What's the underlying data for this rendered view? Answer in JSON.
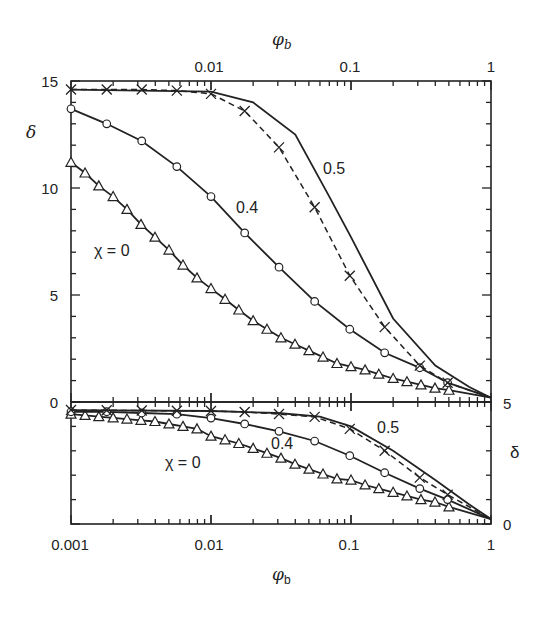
{
  "chart_data": [
    {
      "panel": "upper",
      "type": "line",
      "title": "",
      "xlabel": "φb",
      "ylabel": "δ",
      "xscale": "log",
      "xlim": [
        0.001,
        1
      ],
      "ylim": [
        0,
        15
      ],
      "x_axis_position": "top",
      "x_ticks": [
        "0.01",
        "0.1",
        "1"
      ],
      "y_ticks": [
        "0",
        "5",
        "10",
        "15"
      ],
      "grid": false,
      "annotations": [
        "χ = 0",
        "0.4",
        "0.5"
      ],
      "series": [
        {
          "name": "χ = 0 (triangles)",
          "marker": "triangle",
          "line": "solid",
          "x": [
            0.001,
            0.00126,
            0.00158,
            0.002,
            0.00251,
            0.00316,
            0.00398,
            0.00501,
            0.00631,
            0.00794,
            0.01,
            0.0126,
            0.0158,
            0.02,
            0.0251,
            0.0316,
            0.0398,
            0.0501,
            0.0631,
            0.0794,
            0.1,
            0.126,
            0.158,
            0.2,
            0.251,
            0.316,
            0.398,
            0.501
          ],
          "values": [
            11.2,
            10.7,
            10.1,
            9.6,
            9.0,
            8.3,
            7.7,
            7.1,
            6.4,
            5.8,
            5.3,
            4.8,
            4.3,
            3.8,
            3.4,
            3.0,
            2.7,
            2.4,
            2.1,
            1.8,
            1.65,
            1.5,
            1.3,
            1.1,
            0.95,
            0.8,
            0.65,
            0.55
          ]
        },
        {
          "name": "χ = 0.4 (diamonds)",
          "marker": "diamond",
          "line": "solid",
          "x": [
            0.001,
            0.0018,
            0.0032,
            0.0057,
            0.01,
            0.0174,
            0.0306,
            0.055,
            0.098,
            0.174,
            0.31,
            0.49
          ],
          "values": [
            13.7,
            13.0,
            12.2,
            11.0,
            9.6,
            7.9,
            6.3,
            4.7,
            3.4,
            2.3,
            1.6,
            0.9
          ]
        },
        {
          "name": "χ = 0.5 (crosses)",
          "marker": "cross",
          "line": "dashed",
          "x": [
            0.001,
            0.0018,
            0.0032,
            0.0057,
            0.01,
            0.0174,
            0.0306,
            0.055,
            0.098,
            0.174,
            0.31,
            0.49
          ],
          "values": [
            14.6,
            14.6,
            14.6,
            14.55,
            14.4,
            13.6,
            11.9,
            9.1,
            5.9,
            3.5,
            1.7,
            0.9
          ]
        },
        {
          "name": "χ = 0.5 (solid curve)",
          "marker": "none",
          "line": "solid",
          "x": [
            0.001,
            0.01,
            0.02,
            0.04,
            0.07,
            0.1,
            0.2,
            0.4,
            0.7,
            1.0
          ],
          "values": [
            14.6,
            14.5,
            14.0,
            12.5,
            9.6,
            7.7,
            3.9,
            1.7,
            0.7,
            0.2
          ]
        }
      ]
    },
    {
      "panel": "lower",
      "type": "line",
      "title": "",
      "xlabel": "φb",
      "ylabel": "δ",
      "xscale": "log",
      "xlim": [
        0.001,
        1
      ],
      "ylim": [
        0,
        5
      ],
      "x_axis_position": "bottom",
      "y_axis_position": "right",
      "x_ticks": [
        "0.001",
        "0.01",
        "0.1",
        "1"
      ],
      "y_ticks": [
        "0",
        "5"
      ],
      "grid": false,
      "annotations": [
        "χ = 0",
        "0.4",
        "0.5"
      ],
      "series": [
        {
          "name": "χ = 0 (triangles)",
          "marker": "triangle",
          "line": "solid",
          "x": [
            0.001,
            0.00126,
            0.00158,
            0.002,
            0.00251,
            0.00316,
            0.00398,
            0.00501,
            0.00631,
            0.00794,
            0.01,
            0.0126,
            0.0158,
            0.02,
            0.0251,
            0.0316,
            0.0398,
            0.0501,
            0.0631,
            0.0794,
            0.1,
            0.126,
            0.158,
            0.2,
            0.251,
            0.316,
            0.398,
            0.501
          ],
          "values": [
            4.5,
            4.45,
            4.4,
            4.35,
            4.3,
            4.25,
            4.2,
            4.1,
            4.0,
            3.9,
            3.6,
            3.45,
            3.3,
            3.1,
            2.9,
            2.7,
            2.45,
            2.25,
            2.05,
            1.85,
            1.8,
            1.6,
            1.45,
            1.3,
            1.15,
            1.0,
            0.9,
            0.7
          ]
        },
        {
          "name": "χ = 0.4 (diamonds)",
          "marker": "diamond",
          "line": "solid",
          "x": [
            0.001,
            0.0018,
            0.0032,
            0.0057,
            0.01,
            0.0174,
            0.0306,
            0.055,
            0.098,
            0.174,
            0.31,
            0.49
          ],
          "values": [
            4.6,
            4.6,
            4.55,
            4.5,
            4.34,
            4.1,
            3.8,
            3.4,
            2.8,
            2.1,
            1.45,
            1.0
          ]
        },
        {
          "name": "χ = 0.5 (crosses)",
          "marker": "cross",
          "line": "dashed",
          "x": [
            0.001,
            0.0018,
            0.0032,
            0.0057,
            0.01,
            0.0174,
            0.0306,
            0.055,
            0.098,
            0.174,
            0.31,
            0.49
          ],
          "values": [
            4.67,
            4.66,
            4.65,
            4.64,
            4.63,
            4.59,
            4.51,
            4.39,
            3.9,
            3.0,
            1.9,
            1.2
          ]
        },
        {
          "name": "χ = 0.5 (solid curve)",
          "marker": "none",
          "line": "solid",
          "x": [
            0.001,
            0.01,
            0.03,
            0.06,
            0.1,
            0.2,
            0.4,
            0.7,
            1.0
          ],
          "values": [
            4.67,
            4.63,
            4.55,
            4.4,
            4.0,
            3.0,
            1.8,
            0.8,
            0.2
          ]
        }
      ]
    }
  ],
  "labels": {
    "top_xlabel": "φ",
    "top_xlabel_sub": "b",
    "bottom_xlabel": "φ",
    "bottom_xlabel_sub": "b",
    "upper_ylabel": "δ",
    "lower_ylabel": "δ",
    "upper_annotations": {
      "chi0": "χ = 0",
      "chi04": "0.4",
      "chi05": "0.5"
    },
    "lower_annotations": {
      "chi0": "χ = 0",
      "chi04": "0.4",
      "chi05": "0.5"
    },
    "top_xticks": [
      "0.01",
      "0.1",
      "1"
    ],
    "bottom_xticks": [
      "0.001",
      "0.01",
      "0.1",
      "1"
    ],
    "upper_yticks": [
      "0",
      "5",
      "10",
      "15"
    ],
    "lower_yticks": [
      "0",
      "5"
    ]
  }
}
